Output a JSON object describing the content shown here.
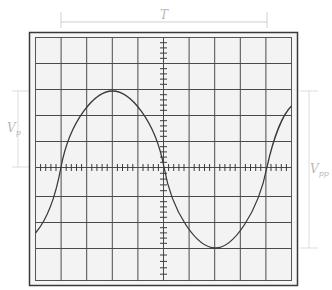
{
  "figure": {
    "labels": {
      "period": "T",
      "peak_voltage": "V",
      "peak_voltage_sub": "p",
      "peak_to_peak_voltage": "V",
      "peak_to_peak_voltage_sub": "pp"
    },
    "grid": {
      "columns": 10,
      "rows": 9,
      "minor_ticks_per_division": 5
    },
    "colors": {
      "screen_background": "#f3f3f3",
      "grid_line": "#4a4a4a",
      "frame": "#333333",
      "trace": "#3a3a3a",
      "dimension": "#c8c8c8"
    }
  }
}
